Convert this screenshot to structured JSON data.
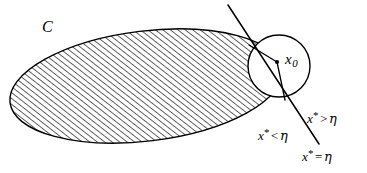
{
  "figure": {
    "kind": "separating-hyperplane-diagram",
    "background_color": "#ffffff",
    "stroke_color": "#000000",
    "hatch_color": "#1a1a1a"
  },
  "labels": {
    "set_label": "C",
    "center_point": {
      "base": "x",
      "subscript": "0"
    },
    "halfplane_greater": {
      "var": "x",
      "star": "*",
      "relation": ">",
      "bound": "η"
    },
    "halfplane_less": {
      "var": "x",
      "star": "*",
      "relation": "<",
      "bound": "η"
    },
    "hyperplane": {
      "var": "x",
      "star": "*",
      "relation": "=",
      "bound": "η"
    }
  },
  "shapes": {
    "convex_set": {
      "name": "hatched-ellipse",
      "center_x": 146,
      "center_y": 86,
      "radius_x": 137,
      "radius_y": 55,
      "rotation_deg": -7,
      "fill": "hatch-45",
      "stroke_width": 1.4
    },
    "ball": {
      "name": "circle",
      "center_x": 279,
      "center_y": 66,
      "radius": 31,
      "stroke_width": 1.4
    },
    "center_dot": {
      "center_x": 277,
      "center_y": 62,
      "radius": 2.1
    },
    "separating_line": {
      "x1": 228,
      "y1": 5,
      "x2": 319,
      "y2": 144,
      "stroke_width": 1.5
    },
    "radius_upper": {
      "x1": 277,
      "y1": 62,
      "x2": 249,
      "y2": 45,
      "stroke_width": 1.3
    },
    "radius_lower": {
      "x1": 277,
      "y1": 62,
      "x2": 285,
      "y2": 100,
      "stroke_width": 1.3
    }
  }
}
